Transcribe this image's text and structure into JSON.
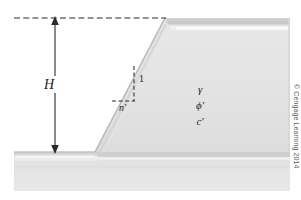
{
  "figure": {
    "kind": "engineering-diagram",
    "background_color": "#ffffff"
  },
  "labels": {
    "height": "H",
    "slope_vertical": "1",
    "slope_horizontal": "n′"
  },
  "soil_parameters": {
    "unit_weight": "γ",
    "friction_angle": "ϕ′",
    "cohesion": "c′"
  },
  "credit": {
    "text": "© Cengage Learning 2014",
    "color": "#5d5d5d"
  },
  "colors": {
    "soil_light": "#e9e9e9",
    "soil_mid": "#dedede",
    "soil_shadow": "#c9c9c9",
    "soil_dark_edge": "#b6b6b6",
    "highlight": "#f4f4f4",
    "line": "#2b2b2b",
    "ground_band": "#d4d4d4"
  },
  "geometry": {
    "crest_level_y": 18,
    "toe_level_y": 152,
    "slope_top_x": 165,
    "slope_toe_x": 95,
    "soil_right_x": 290,
    "dashed_line_start_x": 14,
    "dashed_line_end_x": 166,
    "height_arrow_x": 55
  }
}
